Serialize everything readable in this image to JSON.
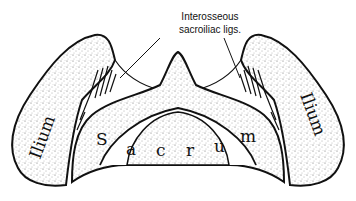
{
  "figure": {
    "callout": {
      "line1": "Interosseous",
      "line2": "sacroiliac ligs."
    },
    "bones": {
      "left_ilium": "Ilium",
      "right_ilium": "Ilium",
      "sacrum": "Sacrum"
    },
    "sacrum_letters": [
      "S",
      "a",
      "c",
      "r",
      "u",
      "m"
    ],
    "colors": {
      "outline": "#111111",
      "background": "#ffffff",
      "stipple": "#555555"
    }
  }
}
